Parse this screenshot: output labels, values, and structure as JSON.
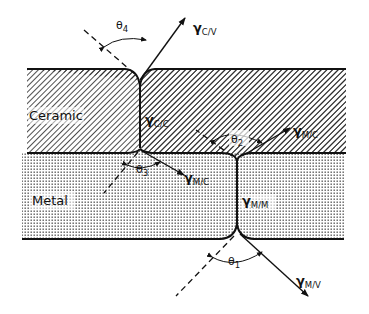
{
  "regions": {
    "ceramic": "Ceramic",
    "metal": "Metal"
  },
  "tensions": {
    "c_v": {
      "symbol": "γ",
      "sub": "C/V"
    },
    "c_c": {
      "symbol": "γ",
      "sub": "C/C"
    },
    "m_c_left": {
      "symbol": "γ",
      "sub": "M/C"
    },
    "m_c_right": {
      "symbol": "γ",
      "sub": "M/C"
    },
    "m_m": {
      "symbol": "γ",
      "sub": "M/M"
    },
    "m_v": {
      "symbol": "γ",
      "sub": "M/V"
    }
  },
  "angles": {
    "theta1": {
      "symbol": "θ",
      "sub": "1"
    },
    "theta2": {
      "symbol": "θ",
      "sub": "2"
    },
    "theta3": {
      "symbol": "θ",
      "sub": "3"
    },
    "theta4": {
      "symbol": "θ",
      "sub": "4"
    }
  },
  "colors": {
    "ink": "#111111",
    "background": "#ffffff"
  }
}
